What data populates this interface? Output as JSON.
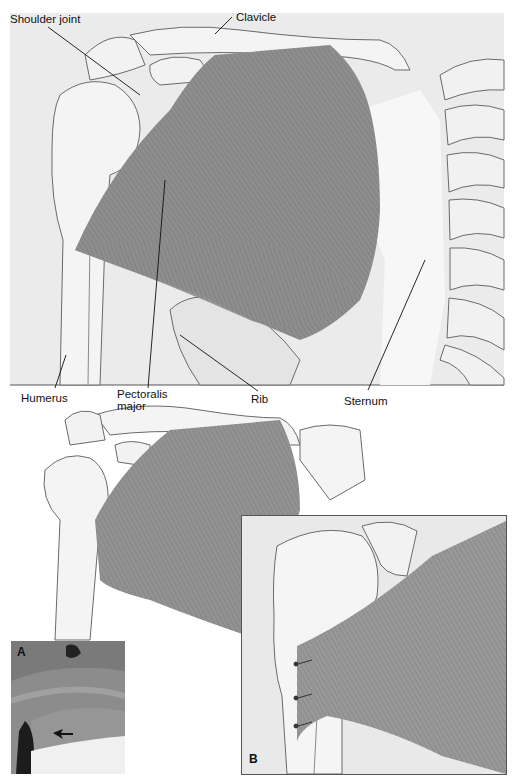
{
  "figure": {
    "top_panel": {
      "labels": {
        "shoulder_joint": "Shoulder joint",
        "clavicle": "Clavicle",
        "humerus": "Humerus",
        "pectoralis_major_line1": "Pectoralis",
        "pectoralis_major_line2": "major",
        "rib": "Rib",
        "sternum": "Sternum"
      }
    },
    "bottom_panel": {
      "photo_panel_letter": "A",
      "inset_panel_letter": "B"
    },
    "colors": {
      "background": "#ffffff",
      "bone_fill": "#f2f2f2",
      "bone_stroke": "#6a6a6a",
      "muscle": "#8c8c8c",
      "muscle_dark": "#707070",
      "panel_bg": "#e8e8e8",
      "photo_bg": "#8a8a8a"
    }
  }
}
